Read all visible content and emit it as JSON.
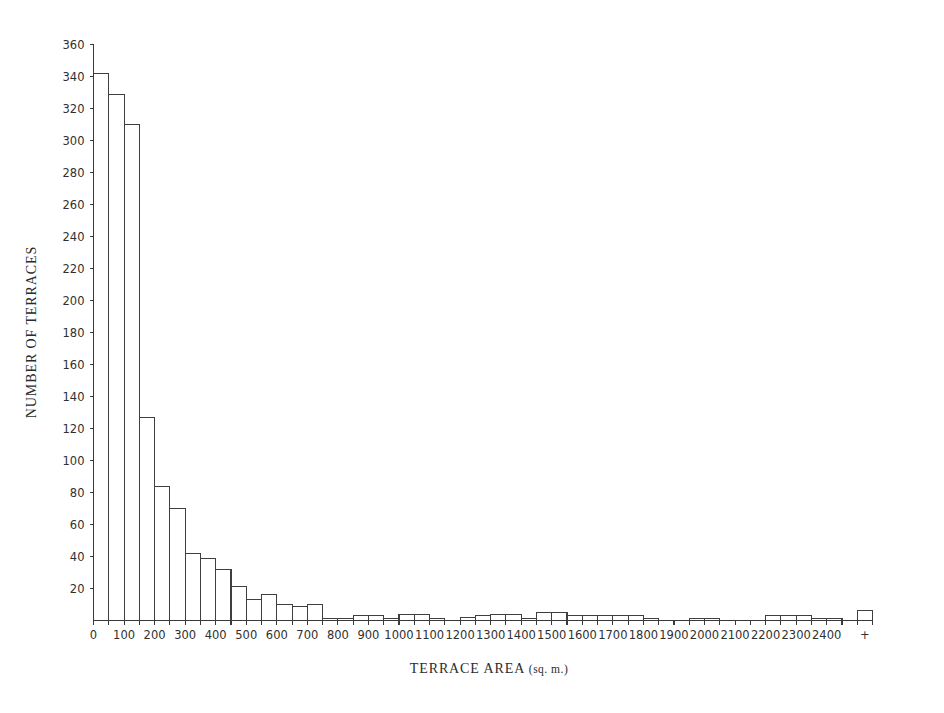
{
  "chart_data": {
    "type": "bar",
    "title": "",
    "xlabel": "TERRACE AREA (sq. m.)",
    "xlabel_main": "TERRACE AREA",
    "xlabel_unit": "(sq. m.)",
    "ylabel": "NUMBER OF TERRACES",
    "ylim": [
      0,
      360
    ],
    "xlim": [
      0,
      2550
    ],
    "grid": false,
    "legend": null,
    "bin_width": 50,
    "y_ticks": [
      0,
      20,
      40,
      60,
      80,
      100,
      120,
      140,
      160,
      180,
      200,
      220,
      240,
      260,
      280,
      300,
      320,
      340,
      360
    ],
    "y_tick_labels": [
      "",
      "20",
      "40",
      "60",
      "80",
      "100",
      "120",
      "140",
      "160",
      "180",
      "200",
      "220",
      "240",
      "260",
      "280",
      "300",
      "320",
      "340",
      "360"
    ],
    "x_ticks": [
      0,
      100,
      200,
      300,
      400,
      500,
      600,
      700,
      800,
      900,
      1000,
      1100,
      1200,
      1300,
      1400,
      1500,
      1600,
      1700,
      1800,
      1900,
      2000,
      2100,
      2200,
      2300,
      2400,
      2500
    ],
    "x_tick_labels": [
      "0",
      "100",
      "200",
      "300",
      "400",
      "500",
      "600",
      "700",
      "800",
      "900",
      "1000",
      "1100",
      "1200",
      "1300",
      "1400",
      "1500",
      "1600",
      "1700",
      "1800",
      "1900",
      "2000",
      "2100",
      "2200",
      "2300",
      "2400",
      "+"
    ],
    "bin_starts": [
      0,
      50,
      100,
      150,
      200,
      250,
      300,
      350,
      400,
      450,
      500,
      550,
      600,
      650,
      700,
      750,
      800,
      850,
      900,
      950,
      1000,
      1050,
      1100,
      1150,
      1200,
      1250,
      1300,
      1350,
      1400,
      1450,
      1500,
      1550,
      1600,
      1650,
      1700,
      1750,
      1800,
      1850,
      1900,
      1950,
      2000,
      2050,
      2100,
      2150,
      2200,
      2250,
      2300,
      2350,
      2400,
      2450,
      2500
    ],
    "values": [
      342,
      329,
      310,
      127,
      84,
      70,
      42,
      39,
      32,
      21,
      13,
      16,
      10,
      9,
      10,
      1,
      1,
      3,
      3,
      1,
      4,
      4,
      1,
      0,
      2,
      3,
      4,
      4,
      1,
      5,
      5,
      3,
      3,
      3,
      3,
      3,
      1,
      0,
      0,
      1,
      1,
      0,
      0,
      0,
      3,
      3,
      3,
      1,
      1,
      0,
      6
    ],
    "categories": [
      "0-50",
      "50-100",
      "100-150",
      "150-200",
      "200-250",
      "250-300",
      "300-350",
      "350-400",
      "400-450",
      "450-500",
      "500-550",
      "550-600",
      "600-650",
      "650-700",
      "700-750",
      "750-800",
      "800-850",
      "850-900",
      "900-950",
      "950-1000",
      "1000-1050",
      "1050-1100",
      "1100-1150",
      "1150-1200",
      "1200-1250",
      "1250-1300",
      "1300-1350",
      "1350-1400",
      "1400-1450",
      "1450-1500",
      "1500-1550",
      "1550-1600",
      "1600-1650",
      "1650-1700",
      "1700-1750",
      "1750-1800",
      "1800-1850",
      "1850-1900",
      "1900-1950",
      "1950-2000",
      "2000-2050",
      "2050-2100",
      "2100-2150",
      "2150-2200",
      "2200-2250",
      "2250-2300",
      "2300-2350",
      "2350-2400",
      "2400-2450",
      "2450-2500",
      "2500+"
    ]
  },
  "style": {
    "bar_fill": "#ffffff",
    "bar_stroke": "#3f3f3f",
    "axis_color": "#3a3a3a",
    "text_color": "#2b2b2b",
    "background": "#ffffff"
  }
}
